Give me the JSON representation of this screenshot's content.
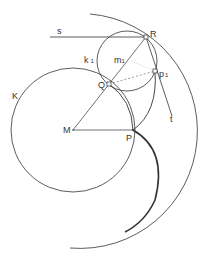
{
  "diagram": {
    "labels": {
      "s": "s",
      "R": "R",
      "k1": "k",
      "k1_sub": "1",
      "m1": "m",
      "m1_sub": "1",
      "p1": "p",
      "p1_sub": "1",
      "Q": "Q",
      "K": "K",
      "M": "M",
      "P": "P",
      "t": "t"
    },
    "colors": {
      "stroke": "#333333",
      "background": "#ffffff"
    }
  }
}
